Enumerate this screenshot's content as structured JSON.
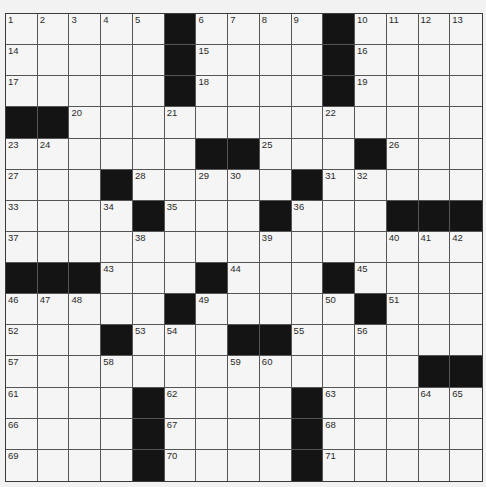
{
  "puzzle": {
    "rows": 15,
    "cols": 15,
    "colors": {
      "background": "#f2f2f2",
      "cell": "#f5f5f5",
      "block": "#141414",
      "line": "#555555",
      "number": "#2a2a2a"
    },
    "grid": [
      [
        "1",
        "2",
        "3",
        "4",
        "5",
        "#",
        "6",
        "7",
        "8",
        "9",
        "#",
        "10",
        "11",
        "12",
        "13"
      ],
      [
        "14",
        "",
        "",
        "",
        "",
        "#",
        "15",
        "",
        "",
        "",
        "#",
        "16",
        "",
        "",
        ""
      ],
      [
        "17",
        "",
        "",
        "",
        "",
        "#",
        "18",
        "",
        "",
        "",
        "#",
        "19",
        "",
        "",
        ""
      ],
      [
        "#",
        "#",
        "20",
        "",
        "",
        "21",
        "",
        "",
        "",
        "",
        "22",
        "",
        "",
        "",
        ""
      ],
      [
        "23",
        "24",
        "",
        "",
        "",
        "",
        "#",
        "#",
        "25",
        "",
        "",
        "#",
        "26",
        "",
        ""
      ],
      [
        "27",
        "",
        "",
        "#",
        "28",
        "",
        "29",
        "30",
        "",
        "#",
        "31",
        "32",
        "",
        "",
        ""
      ],
      [
        "33",
        "",
        "",
        "34",
        "#",
        "35",
        "",
        "",
        "#",
        "36",
        "",
        "",
        "#",
        "#",
        "#"
      ],
      [
        "37",
        "",
        "",
        "",
        "38",
        "",
        "",
        "",
        "39",
        "",
        "",
        "",
        "40",
        "41",
        "42"
      ],
      [
        "#",
        "#",
        "#",
        "43",
        "",
        "",
        "#",
        "44",
        "",
        "",
        "#",
        "45",
        "",
        "",
        ""
      ],
      [
        "46",
        "47",
        "48",
        "",
        "",
        "#",
        "49",
        "",
        "",
        "",
        "50",
        "#",
        "51",
        "",
        ""
      ],
      [
        "52",
        "",
        "",
        "#",
        "53",
        "54",
        "",
        "#",
        "#",
        "55",
        "",
        "56",
        "",
        "",
        ""
      ],
      [
        "57",
        "",
        "",
        "58",
        "",
        "",
        "",
        "59",
        "60",
        "",
        "",
        "",
        "",
        "#",
        "#"
      ],
      [
        "61",
        "",
        "",
        "",
        "#",
        "62",
        "",
        "",
        "",
        "#",
        "63",
        "",
        "",
        "64",
        "65"
      ],
      [
        "66",
        "",
        "",
        "",
        "#",
        "67",
        "",
        "",
        "",
        "#",
        "68",
        "",
        "",
        "",
        ""
      ],
      [
        "69",
        "",
        "",
        "",
        "#",
        "70",
        "",
        "",
        "",
        "#",
        "71",
        "",
        "",
        "",
        ""
      ]
    ]
  }
}
